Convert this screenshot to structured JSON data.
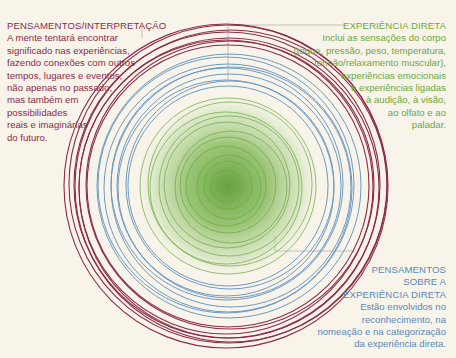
{
  "colors": {
    "background": "#f8f4ea",
    "thoughts_interpretation": "#8c2b4a",
    "direct_experience": "#6fa83a",
    "thoughts_about_experience": "#5a89b8",
    "leader_line": "#b8b4aa"
  },
  "labels": {
    "interpretation": {
      "title": "PENSAMENTOS/INTERPRETAÇÃO",
      "lines": [
        "A mente tentará encontrar",
        "significado nas experiências,",
        "fazendo conexões com outros",
        "tempos, lugares e eventos,",
        "não apenas no passado,",
        "mas também em",
        "possibilidades",
        "reais e imaginárias",
        "do futuro."
      ]
    },
    "direct_experience": {
      "title": "EXPERIÊNCIA DIRETA",
      "lines": [
        "Inclui as sensações do corpo",
        "(toque, pressão, peso, temperatura,",
        "tensão/relaxamento muscular),",
        "experiências emocionais",
        "e experiências ligadas",
        "à audição, à visão,",
        "ao olfato e ao",
        "paladar."
      ]
    },
    "thoughts_about_experience": {
      "title_lines": [
        "PENSAMENTOS",
        "SOBRE A",
        "EXPERIÊNCIA DIRETA"
      ],
      "lines": [
        "Estão envolvidos no",
        "reconhecimento, na",
        "nomeação e na categorização",
        "da experiência direta."
      ]
    }
  },
  "diagram": {
    "center": [
      228,
      186
    ],
    "rings": {
      "outer_red": {
        "count": 8,
        "radius_range": [
          140,
          162
        ]
      },
      "middle_blue": {
        "count": 9,
        "radius_range": [
          100,
          132
        ]
      },
      "inner_green": {
        "count": 12,
        "radius_range": [
          15,
          90
        ]
      }
    }
  }
}
